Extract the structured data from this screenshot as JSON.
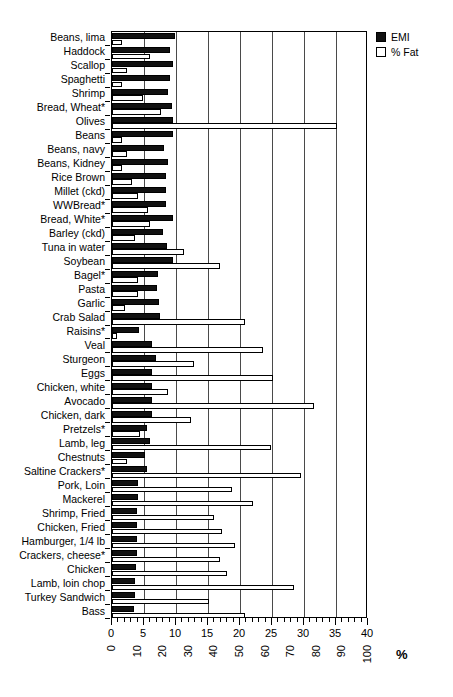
{
  "legend": {
    "position": "top-right",
    "entries": [
      {
        "label": "EMI",
        "swatch": "filled-square-icon",
        "color": "#111111"
      },
      {
        "label": "% Fat",
        "swatch": "hollow-square-icon",
        "color": "#ffffff"
      }
    ]
  },
  "axis": {
    "primary_label": "",
    "secondary_label": "%",
    "emi_ticks": [
      "0",
      "5",
      "10",
      "15",
      "20",
      "25",
      "30",
      "35",
      "40"
    ],
    "fat_ticks": [
      "0",
      "10",
      "20",
      "30",
      "40",
      "50",
      "60",
      "70",
      "80",
      "90",
      "100"
    ],
    "emi_range": [
      0,
      40
    ],
    "fat_range": [
      0,
      100
    ],
    "grid": true
  },
  "chart_data": {
    "type": "bar",
    "orientation": "horizontal",
    "title": "",
    "xlabel": "%",
    "ylabel": "",
    "xlim": [
      0,
      40
    ],
    "xlim_secondary": [
      0,
      100
    ],
    "grid": true,
    "legend_position": "top-right",
    "categories": [
      "Beans, lima",
      "Haddock",
      "Scallop",
      "Spaghetti",
      "Shrimp",
      "Bread, Wheat*",
      "Olives",
      "Beans",
      "Beans, navy",
      "Beans, Kidney",
      "Rice Brown",
      "Millet (ckd)",
      "WWBread*",
      "Bread, White*",
      "Barley (ckd)",
      "Tuna in water",
      "Soybean",
      "Bagel*",
      "Pasta",
      "Garlic",
      "Crab Salad",
      "Raisins*",
      "Veal",
      "Sturgeon",
      "Eggs",
      "Chicken, white",
      "Avocado",
      "Chicken, dark",
      "Pretzels*",
      "Lamb, leg",
      "Chestnuts",
      "Saltine Crackers*",
      "Pork, Loin",
      "Mackerel",
      "Shrimp, Fried",
      "Chicken, Fried",
      "Hamburger, 1/4 lb",
      "Crackers, cheese*",
      "Chicken",
      "Lamb, loin chop",
      "Turkey Sandwich",
      "Bass"
    ],
    "series": [
      {
        "name": "EMI",
        "color": "#111111",
        "axis": "primary",
        "values": [
          9.8,
          9.0,
          9.6,
          9.0,
          8.7,
          9.3,
          9.6,
          9.6,
          8.2,
          8.8,
          8.4,
          8.5,
          8.4,
          9.6,
          8.0,
          8.6,
          9.5,
          7.2,
          7.1,
          7.3,
          7.5,
          4.2,
          6.2,
          6.8,
          6.2,
          6.2,
          6.3,
          6.2,
          5.4,
          6.0,
          5.2,
          5.5,
          4.1,
          4.0,
          3.9,
          3.9,
          3.9,
          3.9,
          3.8,
          3.6,
          3.6,
          3.5
        ]
      },
      {
        "name": "% Fat",
        "color": "#ffffff",
        "axis": "secondary",
        "values": [
          4.0,
          15.0,
          6.0,
          4.0,
          12.0,
          19.0,
          88.0,
          4.0,
          6.0,
          4.0,
          8.0,
          10.0,
          14.0,
          15.0,
          9.0,
          28.0,
          42.0,
          10.0,
          10.0,
          5.0,
          52.0,
          2.0,
          59.0,
          32.0,
          63.0,
          22.0,
          79.0,
          31.0,
          11.0,
          62.0,
          6.0,
          74.0,
          47.0,
          55.0,
          40.0,
          43.0,
          48.0,
          42.0,
          45.0,
          71.0,
          38.0,
          52.0
        ]
      }
    ]
  }
}
